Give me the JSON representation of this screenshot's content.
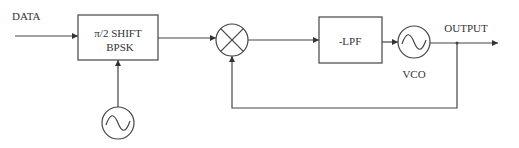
{
  "diagram": {
    "input_label": "DATA",
    "bpsk_block": {
      "line1": "π/2 SHIFT",
      "line2": "BPSK"
    },
    "lpf_block": {
      "label": "-LPF"
    },
    "vco_label": "VCO",
    "output_label": "OUTPUT",
    "stroke_color": "#444444"
  }
}
